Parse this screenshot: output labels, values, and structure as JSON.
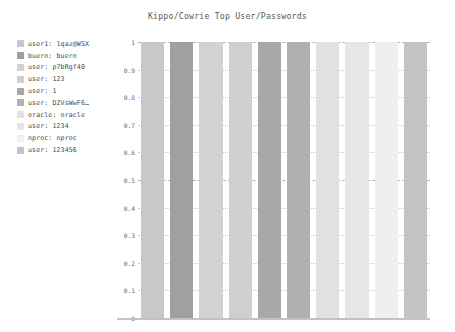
{
  "chart_data": {
    "type": "bar",
    "title": "Kippo/Cowrie Top User/Passwords",
    "xlabel": "",
    "ylabel": "",
    "ylim": [
      0,
      1
    ],
    "grid": true,
    "legend_position": "upper-left-outside",
    "ytick_labels": [
      "1",
      "0.9",
      "0.8",
      "0.7",
      "0.6",
      "0.5",
      "0.4",
      "0.3",
      "0.2",
      "0.1",
      "0"
    ],
    "ytick_values": [
      1,
      0.9,
      0.8,
      0.7,
      0.6,
      0.5,
      0.4,
      0.3,
      0.2,
      0.1,
      0
    ],
    "categories": [
      "user1: 1qaz@WSX",
      "buero: buero",
      "user: p7bRgf40",
      "user: 123",
      "user: 1",
      "user: DZVsWwF6…",
      "oracle: oracle",
      "user: 1234",
      "nproc: nproc",
      "user: 123456"
    ],
    "values": [
      1,
      1,
      1,
      1,
      1,
      1,
      1,
      1,
      1,
      1
    ],
    "colors": [
      "#c8c8c8",
      "#a0a0a0",
      "#d2d2d2",
      "#cfcfcf",
      "#a8a8a8",
      "#b0b0b0",
      "#e2e2e2",
      "#e6e6e6",
      "#efefef",
      "#c4c4c4"
    ]
  },
  "legend": {
    "items": [
      {
        "label": "user1: 1qaz@WSX",
        "color": "#c8c8c8"
      },
      {
        "label": "buero: buero",
        "color": "#a0a0a0"
      },
      {
        "label": "user: p7bRgf40",
        "color": "#d2d2d2"
      },
      {
        "label": "user: 123",
        "color": "#cfcfcf"
      },
      {
        "label": "user: 1",
        "color": "#a8a8a8"
      },
      {
        "label": "user: DZVsWwF6…",
        "color": "#b0b0b0"
      },
      {
        "label": "oracle: oracle",
        "color": "#e2e2e2"
      },
      {
        "label": "user: 1234",
        "color": "#e6e6e6"
      },
      {
        "label": "nproc: nproc",
        "color": "#efefef"
      },
      {
        "label": "user: 123456",
        "color": "#c4c4c4"
      }
    ]
  },
  "style": {
    "background": "#ffffff",
    "grid_color": "#c9c9c9",
    "major_grid_color": "#b3b3b3",
    "axis_color": "#c2c2c2",
    "title_color": "#5a5a5a",
    "tick_color": "#6a6a6a"
  }
}
